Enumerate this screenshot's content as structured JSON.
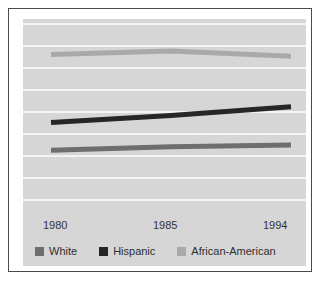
{
  "chart_data": {
    "type": "line",
    "title": "",
    "subtitle": "",
    "xlabel": "",
    "ylabel": "",
    "x": [
      1980,
      1985,
      1994
    ],
    "xticklabels": [
      "1980",
      "1985",
      "1994"
    ],
    "ylim": [
      0,
      100
    ],
    "yticklabels": [],
    "grid": true,
    "grid_orientation": "horizontal",
    "grid_count": 9,
    "legend_position": "bottom",
    "series": [
      {
        "name": "White",
        "color": "#6e6e6e",
        "values": [
          28,
          30,
          31
        ]
      },
      {
        "name": "Hispanic",
        "color": "#262626",
        "values": [
          44,
          48,
          53
        ]
      },
      {
        "name": "African-American",
        "color": "#a9a9a9",
        "values": [
          83,
          85,
          82
        ]
      }
    ]
  },
  "axis": {
    "ticks": [
      {
        "label": "1980"
      },
      {
        "label": "1985"
      },
      {
        "label": "1994"
      }
    ]
  },
  "legend": {
    "entries": [
      {
        "label": "White",
        "color": "#6e6e6e"
      },
      {
        "label": "Hispanic",
        "color": "#262626"
      },
      {
        "label": "African-American",
        "color": "#a9a9a9"
      }
    ]
  },
  "colors": {
    "panel_background": "#d6d6d6",
    "gridline": "#f4f4f4",
    "frame_border": "#4a4a4a",
    "page_background": "#ffffff",
    "text": "#2e2e2e"
  }
}
